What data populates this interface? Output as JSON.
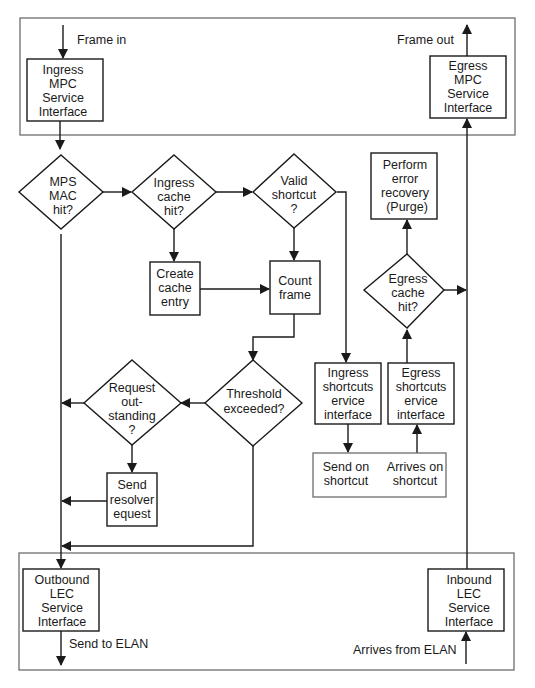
{
  "diagram": {
    "colors": {
      "line": "#1a1a1a",
      "frame": "#6e6e6e",
      "background": "#ffffff"
    },
    "labels": {
      "frame_in": "Frame in",
      "frame_out": "Frame out",
      "send_to_elan": "Send to ELAN",
      "arrives_from_elan": "Arrives from ELAN"
    },
    "nodes": {
      "ingress_mpc": {
        "type": "process",
        "lines": [
          "Ingress",
          "MPC",
          "Service",
          "Interface"
        ]
      },
      "egress_mpc": {
        "type": "process",
        "lines": [
          "Egress",
          "MPC",
          "Service",
          "Interface"
        ]
      },
      "mps_mac_hit": {
        "type": "decision",
        "lines": [
          "MPS",
          "MAC",
          "hit?"
        ]
      },
      "ingress_cache_hit": {
        "type": "decision",
        "lines": [
          "Ingress",
          "cache",
          "hit?"
        ]
      },
      "valid_shortcut": {
        "type": "decision",
        "lines": [
          "Valid",
          "shortcut",
          "?"
        ]
      },
      "create_cache_entry": {
        "type": "process",
        "lines": [
          "Create",
          "cache",
          "entry"
        ]
      },
      "count_frame": {
        "type": "process",
        "lines": [
          "Count",
          "frame"
        ]
      },
      "threshold_exceeded": {
        "type": "decision",
        "lines": [
          "Threshold",
          "exceeded?"
        ]
      },
      "request_outstanding": {
        "type": "decision",
        "lines": [
          "Request",
          "out-",
          "standing",
          "?"
        ]
      },
      "send_resolver_request": {
        "type": "process",
        "lines": [
          "Send",
          "resolver",
          "equest"
        ]
      },
      "perform_error_recovery": {
        "type": "process",
        "lines": [
          "Perform",
          "error",
          "recovery",
          "(Purge)"
        ]
      },
      "egress_cache_hit": {
        "type": "decision",
        "lines": [
          "Egress",
          "cache",
          "hit?"
        ]
      },
      "ingress_shortcut_service": {
        "type": "process",
        "lines": [
          "Ingress",
          "shortcuts",
          "ervice",
          "interface"
        ]
      },
      "egress_shortcut_service": {
        "type": "process",
        "lines": [
          "Egress",
          "shortcuts",
          "ervice",
          "interface"
        ]
      },
      "send_on_shortcut": {
        "type": "terminal",
        "lines": [
          "Send on",
          "shortcut"
        ]
      },
      "arrives_on_shortcut": {
        "type": "terminal",
        "lines": [
          "Arrives  on",
          "shortcut"
        ]
      },
      "outbound_lec": {
        "type": "process",
        "lines": [
          "Outbound",
          "LEC",
          "Service",
          "Interface"
        ]
      },
      "inbound_lec": {
        "type": "process",
        "lines": [
          "Inbound",
          "LEC",
          "Service",
          "Interface"
        ]
      }
    },
    "edges": [
      {
        "from": "frame_in",
        "to": "ingress_mpc"
      },
      {
        "from": "ingress_mpc",
        "to": "mps_mac_hit"
      },
      {
        "from": "mps_mac_hit",
        "to": "ingress_cache_hit"
      },
      {
        "from": "mps_mac_hit",
        "to": "outbound_lec"
      },
      {
        "from": "ingress_cache_hit",
        "to": "valid_shortcut"
      },
      {
        "from": "ingress_cache_hit",
        "to": "create_cache_entry"
      },
      {
        "from": "create_cache_entry",
        "to": "count_frame"
      },
      {
        "from": "valid_shortcut",
        "to": "count_frame"
      },
      {
        "from": "valid_shortcut",
        "to": "ingress_shortcut_service"
      },
      {
        "from": "count_frame",
        "to": "threshold_exceeded"
      },
      {
        "from": "threshold_exceeded",
        "to": "request_outstanding"
      },
      {
        "from": "threshold_exceeded",
        "to": "outbound_lec"
      },
      {
        "from": "request_outstanding",
        "to": "outbound_lec"
      },
      {
        "from": "request_outstanding",
        "to": "send_resolver_request"
      },
      {
        "from": "send_resolver_request",
        "to": "outbound_lec"
      },
      {
        "from": "ingress_shortcut_service",
        "to": "send_on_shortcut"
      },
      {
        "from": "arrives_on_shortcut",
        "to": "egress_shortcut_service"
      },
      {
        "from": "egress_shortcut_service",
        "to": "egress_cache_hit"
      },
      {
        "from": "egress_cache_hit",
        "to": "perform_error_recovery"
      },
      {
        "from": "egress_cache_hit",
        "to": "egress_mpc"
      },
      {
        "from": "inbound_lec",
        "to": "egress_mpc"
      },
      {
        "from": "egress_mpc",
        "to": "frame_out"
      },
      {
        "from": "outbound_lec",
        "to": "send_to_elan"
      },
      {
        "from": "arrives_from_elan",
        "to": "inbound_lec"
      }
    ]
  }
}
